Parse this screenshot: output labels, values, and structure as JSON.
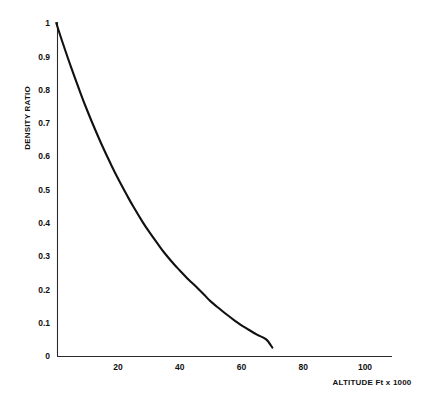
{
  "chart_data": {
    "type": "line",
    "title": "",
    "subtitle": "",
    "xlabel": "ALTITUDE Ft x 1000",
    "ylabel": "DENSITY RATIO",
    "xlim": [
      0,
      110
    ],
    "ylim": [
      0,
      1
    ],
    "grid": false,
    "legend": "none",
    "x_ticks": [
      "20",
      "40",
      "60",
      "80",
      "100"
    ],
    "x_tick_values": [
      20,
      40,
      60,
      80,
      100
    ],
    "y_ticks": [
      "0",
      "0.1",
      "0.2",
      "0.3",
      "0.4",
      "0.5",
      "0.6",
      "0.7",
      "0.8",
      "0.9",
      "1"
    ],
    "y_tick_values": [
      0,
      0.1,
      0.2,
      0.3,
      0.4,
      0.5,
      0.6,
      0.7,
      0.8,
      0.9,
      1
    ],
    "series": [
      {
        "name": "Density ratio vs altitude",
        "color": "#111111",
        "x": [
          0,
          2,
          5,
          8,
          10,
          12,
          15,
          18,
          20,
          23,
          25,
          28,
          30,
          33,
          35,
          38,
          40,
          43,
          45,
          48,
          50,
          53,
          55,
          58,
          60,
          63,
          65,
          68,
          70
        ],
        "y": [
          1.0,
          0.943,
          0.862,
          0.786,
          0.738,
          0.693,
          0.629,
          0.57,
          0.533,
          0.481,
          0.448,
          0.402,
          0.374,
          0.335,
          0.31,
          0.277,
          0.257,
          0.228,
          0.211,
          0.183,
          0.164,
          0.141,
          0.126,
          0.105,
          0.092,
          0.075,
          0.064,
          0.05,
          0.025
        ]
      }
    ]
  },
  "axes": {
    "y_label": "DENSITY RATIO",
    "x_label": "ALTITUDE Ft x 1000"
  }
}
